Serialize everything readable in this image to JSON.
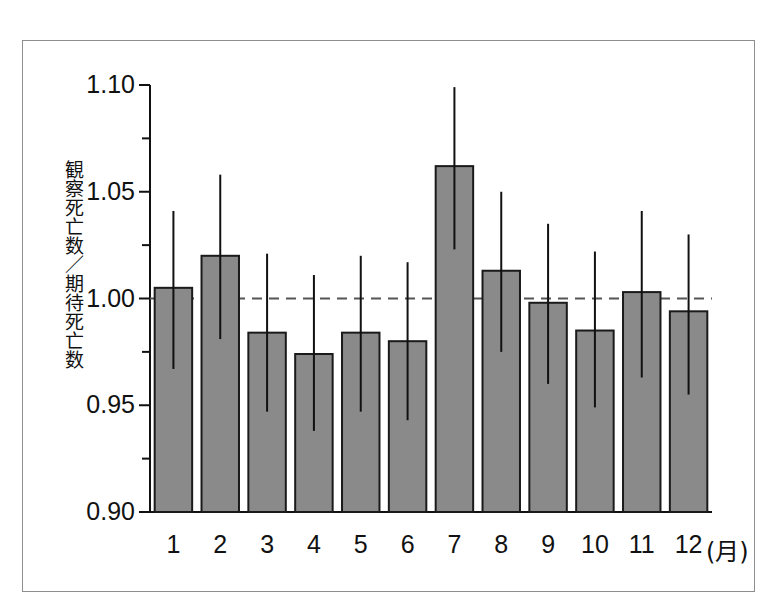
{
  "figure": {
    "background_color": "#ffffff",
    "frame_color": "#8e8e8e",
    "bar_fill_color": "#8a8a8a",
    "bar_edge_color": "#1a1a1a",
    "errorbar_color": "#111111",
    "reference_line_color": "#555555"
  },
  "axis": {
    "y_label": "観察死亡数／期待死亡数",
    "y_ticks": [
      "1.10",
      "1.05",
      "1.00",
      "0.95",
      "0.90"
    ],
    "y_tick_values": [
      1.1,
      1.05,
      1.0,
      0.95,
      0.9
    ],
    "y_minor_tick_values": [
      1.075,
      1.025,
      0.975,
      0.925
    ],
    "x_unit_label": "(月)",
    "x_ticks": [
      "1",
      "2",
      "3",
      "4",
      "5",
      "6",
      "7",
      "8",
      "9",
      "10",
      "11",
      "12"
    ]
  },
  "chart_data": {
    "type": "bar",
    "title": "",
    "subtitle": "",
    "xlabel": "(月)",
    "ylabel": "観察死亡数／期待死亡数",
    "categories": [
      "1",
      "2",
      "3",
      "4",
      "5",
      "6",
      "7",
      "8",
      "9",
      "10",
      "11",
      "12"
    ],
    "values": [
      1.005,
      1.02,
      0.984,
      0.974,
      0.984,
      0.98,
      1.062,
      1.013,
      0.998,
      0.985,
      1.003,
      0.994
    ],
    "error_upper": [
      1.041,
      1.058,
      1.021,
      1.011,
      1.02,
      1.017,
      1.099,
      1.05,
      1.035,
      1.022,
      1.041,
      1.03
    ],
    "error_lower": [
      0.967,
      0.981,
      0.947,
      0.938,
      0.947,
      0.943,
      1.023,
      0.975,
      0.96,
      0.949,
      0.963,
      0.955
    ],
    "reference_line": 1.0,
    "reference_line_style": "dashed",
    "ylim": [
      0.9,
      1.1
    ],
    "grid": false,
    "legend": null,
    "legend_position": "none"
  }
}
